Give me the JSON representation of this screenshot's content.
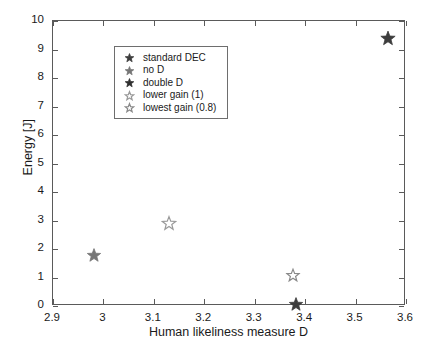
{
  "chart_data": {
    "type": "scatter",
    "title": "",
    "xlabel": "Human likeliness measure D",
    "ylabel": "Energy [J]",
    "xlim": [
      2.9,
      3.6
    ],
    "ylim": [
      0,
      10
    ],
    "xticks": [
      "2.9",
      "3",
      "3.1",
      "3.2",
      "3.3",
      "3.4",
      "3.5",
      "3.6"
    ],
    "xtick_values": [
      2.9,
      3.0,
      3.1,
      3.2,
      3.3,
      3.4,
      3.5,
      3.6
    ],
    "yticks": [
      "0",
      "1",
      "2",
      "3",
      "4",
      "5",
      "6",
      "7",
      "8",
      "9",
      "10"
    ],
    "ytick_values": [
      0,
      1,
      2,
      3,
      4,
      5,
      6,
      7,
      8,
      9,
      10
    ],
    "grid": false,
    "legend_position": "upper left",
    "marker": "star",
    "series": [
      {
        "name": "standard DEC",
        "x": 3.565,
        "y": 9.4,
        "color": "#3d3d3d",
        "filled": true,
        "size": 15
      },
      {
        "name": "no D",
        "x": 2.982,
        "y": 1.78,
        "color": "#767676",
        "filled": true,
        "size": 14
      },
      {
        "name": "double D",
        "x": 3.382,
        "y": 0.06,
        "color": "#3d3d3d",
        "filled": true,
        "size": 14
      },
      {
        "name": "lower gain (1)",
        "x": 3.131,
        "y": 2.9,
        "color": "#9a9a9a",
        "filled": false,
        "size": 14
      },
      {
        "name": "lowest gain (0.8)",
        "x": 3.376,
        "y": 1.09,
        "color": "#8a8a8a",
        "filled": false,
        "size": 13
      }
    ]
  },
  "legend": {
    "entries": [
      {
        "label": "standard DEC",
        "color": "#3d3d3d",
        "filled": true
      },
      {
        "label": "no D",
        "color": "#767676",
        "filled": true
      },
      {
        "label": "double D",
        "color": "#2f2f2f",
        "filled": true
      },
      {
        "label": "lower gain (1)",
        "color": "#9a9a9a",
        "filled": false
      },
      {
        "label": "lowest gain (0.8)",
        "color": "#8a8a8a",
        "filled": false
      }
    ]
  },
  "colors": {
    "axis": "#5a5a5a",
    "text": "#1a1a1a",
    "background": "#ffffff"
  }
}
